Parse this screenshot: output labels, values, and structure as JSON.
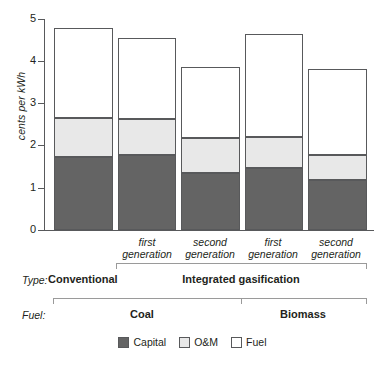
{
  "chart_data": {
    "type": "bar",
    "subtype": "stacked",
    "title": "",
    "xlabel": "",
    "ylabel": "cents per kWh",
    "ylim": [
      0,
      5
    ],
    "yticks": [
      0,
      1,
      2,
      3,
      4,
      5
    ],
    "ytick_labels": [
      "0",
      "1",
      "2",
      "3",
      "4",
      "5"
    ],
    "grid": false,
    "legend_position": "bottom-center",
    "categories": [
      "Conventional / Coal",
      "first generation",
      "second generation",
      "first generation",
      "second generation"
    ],
    "series": [
      {
        "name": "Capital",
        "color": "#646464",
        "values": [
          1.72,
          1.78,
          1.35,
          1.46,
          1.18
        ]
      },
      {
        "name": "O&M",
        "color": "#e8e8e8",
        "values": [
          0.94,
          0.86,
          0.82,
          0.74,
          0.6
        ]
      },
      {
        "name": "Fuel",
        "color": "#ffffff",
        "values": [
          2.13,
          1.91,
          1.69,
          2.45,
          2.04
        ]
      }
    ],
    "totals": [
      4.79,
      4.55,
      3.86,
      4.65,
      3.82
    ]
  },
  "axis": {
    "y_title": "cents per kWh",
    "ticks": [
      "5",
      "4",
      "3",
      "2",
      "1",
      "0"
    ]
  },
  "bars": [
    {
      "generation": ""
    },
    {
      "generation": "first\ngeneration"
    },
    {
      "generation": "second\ngeneration"
    },
    {
      "generation": "first\ngeneration"
    },
    {
      "generation": "second\ngeneration"
    }
  ],
  "gen_labels": [
    {
      "line1": "first",
      "line2": "generation"
    },
    {
      "line1": "second",
      "line2": "generation"
    },
    {
      "line1": "first",
      "line2": "generation"
    },
    {
      "line1": "second",
      "line2": "generation"
    }
  ],
  "type_row": {
    "key": "Type:",
    "values": [
      "Conventional",
      "Integrated gasification"
    ]
  },
  "fuel_row": {
    "key": "Fuel:",
    "values": [
      "Coal",
      "Biomass"
    ]
  },
  "legend": {
    "items": [
      {
        "label": "Capital",
        "swatch": "dark-gray"
      },
      {
        "label": "O&M",
        "swatch": "light-gray"
      },
      {
        "label": "Fuel",
        "swatch": "white"
      }
    ]
  },
  "colors": {
    "capital": "#646464",
    "om": "#e8e8e8",
    "fuel": "#ffffff",
    "outline": "#58595b",
    "bracket": "#9a9a9a",
    "text": "#231f20",
    "background": "#ffffff"
  }
}
